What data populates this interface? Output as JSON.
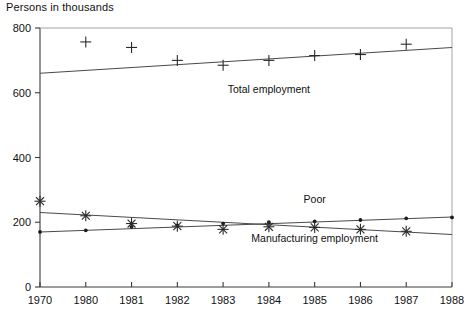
{
  "chart_data": {
    "type": "line",
    "title": "Persons in thousands",
    "xlabel": "",
    "ylabel": "Persons in thousands",
    "grid": false,
    "legend_position": "inline-annotations",
    "xlim": [
      1970,
      1988
    ],
    "ylim": [
      0,
      800
    ],
    "yticks": [
      0,
      200,
      400,
      600,
      800
    ],
    "ytick_labels": [
      "0",
      "200",
      "400",
      "600",
      "800"
    ],
    "xticks": [
      1970,
      1980,
      1981,
      1982,
      1983,
      1984,
      1985,
      1986,
      1987,
      1988
    ],
    "xtick_labels": [
      "1970",
      "1980",
      "1981",
      "1982",
      "1983",
      "1984",
      "1985",
      "1986",
      "1987",
      "1988"
    ],
    "x_axis_is_categorical": true,
    "series": [
      {
        "name": "Total employment",
        "marker": "plus",
        "annotation": "Total employment",
        "x": [
          1980,
          1981,
          1982,
          1983,
          1984,
          1985,
          1986,
          1987
        ],
        "values": [
          757,
          740,
          700,
          685,
          700,
          715,
          718,
          750
        ],
        "fit_line": {
          "x": [
            1970,
            1988
          ],
          "y": [
            660,
            740
          ]
        }
      },
      {
        "name": "Poor",
        "marker": "dot",
        "annotation": "Poor",
        "x": [
          1970,
          1980,
          1981,
          1982,
          1983,
          1984,
          1985,
          1986,
          1987,
          1988
        ],
        "values": [
          170,
          175,
          186,
          190,
          196,
          200,
          203,
          207,
          212,
          215
        ],
        "fit_line": {
          "x": [
            1970,
            1988
          ],
          "y": [
            170,
            216
          ]
        }
      },
      {
        "name": "Manufacturing employment",
        "marker": "star",
        "annotation": "Manufacturing employment",
        "x": [
          1970,
          1980,
          1981,
          1982,
          1983,
          1984,
          1985,
          1986,
          1987
        ],
        "values": [
          265,
          220,
          196,
          188,
          178,
          186,
          184,
          178,
          172
        ],
        "fit_line": {
          "x": [
            1970,
            1988
          ],
          "y": [
            230,
            162
          ]
        }
      }
    ],
    "annotations": [
      {
        "text": "Total employment",
        "x": 1984,
        "y": 600
      },
      {
        "text": "Poor",
        "x": 1985,
        "y": 258
      },
      {
        "text": "Manufacturing employment",
        "x": 1985,
        "y": 140
      }
    ],
    "colors": {
      "axis": "#3a3a3a",
      "frame": "#9a9a9a",
      "line": "#4a4a4a",
      "marker": "#2b2b2b",
      "background": "#ffffff"
    }
  }
}
